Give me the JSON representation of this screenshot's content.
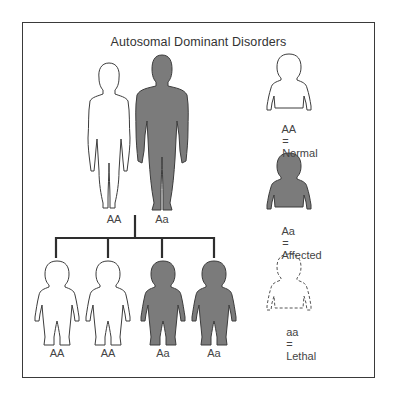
{
  "title": "Autosomal Dominant Disorders",
  "colors": {
    "affected_fill": "#7b7b7b",
    "outline": "#3c3c3c",
    "normal_fill": "#ffffff",
    "frame": "#3a3a3a",
    "text": "#444444"
  },
  "parents": [
    {
      "sex": "female",
      "genotype": "AA",
      "status": "normal"
    },
    {
      "sex": "male",
      "genotype": "Aa",
      "status": "affected"
    }
  ],
  "children": [
    {
      "genotype": "AA",
      "status": "normal"
    },
    {
      "genotype": "AA",
      "status": "normal"
    },
    {
      "genotype": "Aa",
      "status": "affected"
    },
    {
      "genotype": "Aa",
      "status": "affected"
    }
  ],
  "legend": [
    {
      "genotype": "AA",
      "equals": "=",
      "meaning": "Normal",
      "style": "outline"
    },
    {
      "genotype": "Aa",
      "equals": "=",
      "meaning": "Affected",
      "style": "filled"
    },
    {
      "genotype": "aa",
      "equals": "=",
      "meaning": "Lethal",
      "style": "dashed"
    }
  ]
}
